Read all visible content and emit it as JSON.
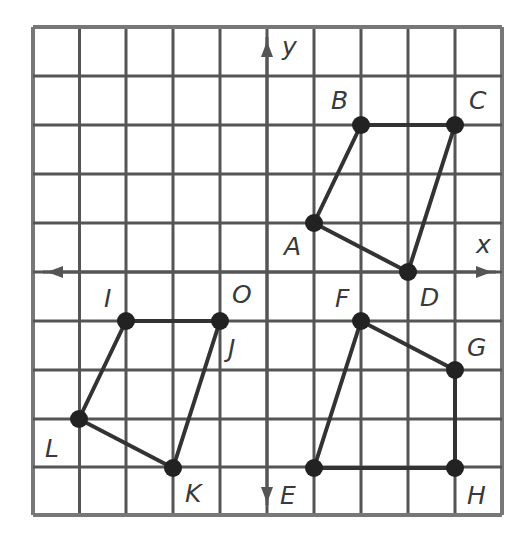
{
  "diagram": {
    "type": "coordinate-grid",
    "grid": {
      "columns": 10,
      "rows": 10,
      "x_lines": [
        33,
        79.5,
        126,
        173,
        220,
        267,
        314,
        361,
        408,
        455,
        502
      ],
      "y_lines": [
        27,
        76,
        125,
        174,
        223,
        272,
        321,
        370,
        419,
        467,
        515
      ],
      "origin_px": [
        267,
        272
      ],
      "unit_px": [
        47,
        49
      ],
      "line_color": "#555555",
      "border_color": "#777777"
    },
    "axes": {
      "x_label": "x",
      "y_label": "y",
      "origin_label": "O",
      "color": "#555555"
    },
    "figures": [
      {
        "name": "ABCD",
        "vertices": [
          {
            "label": "A",
            "x": 1,
            "y": 1,
            "label_dx": -30,
            "label_dy": 32
          },
          {
            "label": "B",
            "x": 2,
            "y": 3,
            "label_dx": -30,
            "label_dy": -16
          },
          {
            "label": "C",
            "x": 4,
            "y": 3,
            "label_dx": 14,
            "label_dy": -16
          },
          {
            "label": "D",
            "x": 3,
            "y": 0,
            "label_dx": 12,
            "label_dy": 34
          }
        ],
        "order": [
          "A",
          "B",
          "C",
          "D"
        ]
      },
      {
        "name": "IJKL",
        "vertices": [
          {
            "label": "I",
            "x": -3,
            "y": -1,
            "label_dx": -22,
            "label_dy": -14
          },
          {
            "label": "J",
            "x": -1,
            "y": -1,
            "label_dx": 8,
            "label_dy": 36
          },
          {
            "label": "K",
            "x": -2,
            "y": -4,
            "label_dx": 12,
            "label_dy": 34
          },
          {
            "label": "L",
            "x": -4,
            "y": -3,
            "label_dx": -34,
            "label_dy": 38
          }
        ],
        "order": [
          "I",
          "J",
          "K",
          "L"
        ]
      },
      {
        "name": "EFGH",
        "vertices": [
          {
            "label": "E",
            "x": 1,
            "y": -4,
            "label_dx": -34,
            "label_dy": 36
          },
          {
            "label": "F",
            "x": 2,
            "y": -1,
            "label_dx": -26,
            "label_dy": -14
          },
          {
            "label": "G",
            "x": 4,
            "y": -2,
            "label_dx": 12,
            "label_dy": -14
          },
          {
            "label": "H",
            "x": 4,
            "y": -4,
            "label_dx": 12,
            "label_dy": 36
          }
        ],
        "order": [
          "E",
          "F",
          "G",
          "H"
        ]
      }
    ],
    "point_color": "#222222",
    "edge_color": "#333333"
  }
}
